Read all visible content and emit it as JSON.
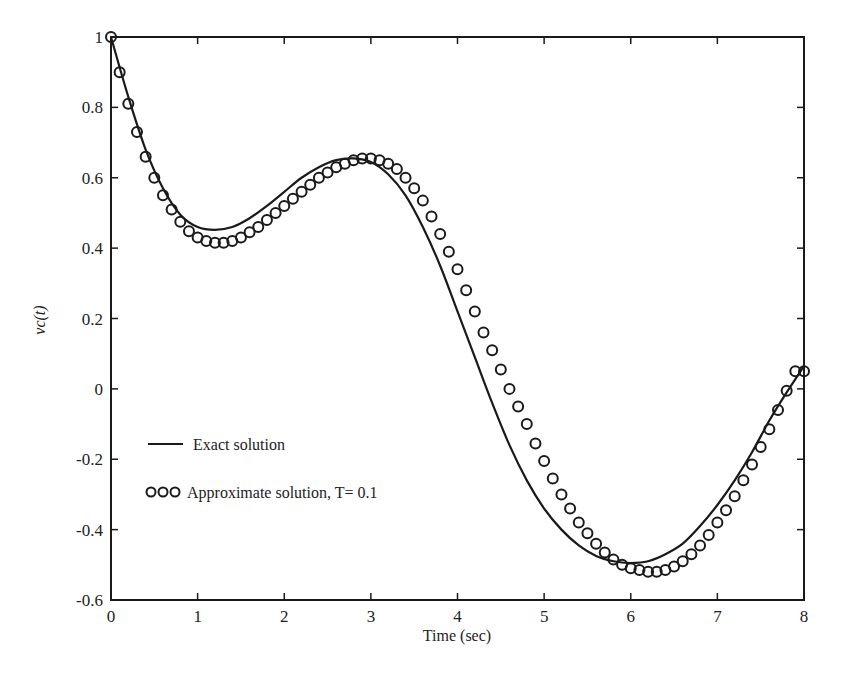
{
  "chart_data": {
    "type": "line",
    "title": "",
    "xlabel": "Time (sec)",
    "ylabel": "vc(t)",
    "xlim": [
      0,
      8
    ],
    "ylim": [
      -0.6,
      1.0
    ],
    "xticks": [
      0,
      1,
      2,
      3,
      4,
      5,
      6,
      7,
      8
    ],
    "xtick_labels": [
      "0",
      "1",
      "2",
      "3",
      "4",
      "5",
      "6",
      "7",
      "8"
    ],
    "yticks": [
      -0.6,
      -0.4,
      -0.2,
      0,
      0.2,
      0.4,
      0.6,
      0.8,
      1.0
    ],
    "ytick_labels": [
      "-0.6",
      "-0.4",
      "-0.2",
      "0",
      "0.2",
      "0.4",
      "0.6",
      "0.8",
      "1"
    ],
    "grid": false,
    "legend_position": "lower-left inside",
    "series": [
      {
        "name": "Exact solution",
        "style": "solid-line",
        "color": "#1a1a1a",
        "x": [
          0,
          0.2,
          0.4,
          0.6,
          0.8,
          1.0,
          1.2,
          1.4,
          1.6,
          1.8,
          2.0,
          2.2,
          2.4,
          2.6,
          2.8,
          3.0,
          3.2,
          3.4,
          3.6,
          3.8,
          4.0,
          4.2,
          4.4,
          4.6,
          4.8,
          5.0,
          5.2,
          5.4,
          5.6,
          5.8,
          6.0,
          6.2,
          6.4,
          6.6,
          6.8,
          7.0,
          7.2,
          7.4,
          7.6,
          7.8,
          8.0
        ],
        "y": [
          1.0,
          0.83,
          0.68,
          0.57,
          0.495,
          0.46,
          0.452,
          0.46,
          0.485,
          0.52,
          0.56,
          0.6,
          0.63,
          0.65,
          0.655,
          0.645,
          0.61,
          0.55,
          0.46,
          0.35,
          0.22,
          0.09,
          -0.04,
          -0.16,
          -0.26,
          -0.34,
          -0.4,
          -0.445,
          -0.475,
          -0.49,
          -0.495,
          -0.49,
          -0.47,
          -0.44,
          -0.39,
          -0.33,
          -0.26,
          -0.18,
          -0.09,
          -0.01,
          0.065
        ]
      },
      {
        "name": "Approximate solution, T= 0.1",
        "style": "open-circle-markers",
        "color": "#1a1a1a",
        "x": [
          0,
          0.1,
          0.2,
          0.3,
          0.4,
          0.5,
          0.6,
          0.7,
          0.8,
          0.9,
          1.0,
          1.1,
          1.2,
          1.3,
          1.4,
          1.5,
          1.6,
          1.7,
          1.8,
          1.9,
          2.0,
          2.1,
          2.2,
          2.3,
          2.4,
          2.5,
          2.6,
          2.7,
          2.8,
          2.9,
          3.0,
          3.1,
          3.2,
          3.3,
          3.4,
          3.5,
          3.6,
          3.7,
          3.8,
          3.9,
          4.0,
          4.1,
          4.2,
          4.3,
          4.4,
          4.5,
          4.6,
          4.7,
          4.8,
          4.9,
          5.0,
          5.1,
          5.2,
          5.3,
          5.4,
          5.5,
          5.6,
          5.7,
          5.8,
          5.9,
          6.0,
          6.1,
          6.2,
          6.3,
          6.4,
          6.5,
          6.6,
          6.7,
          6.8,
          6.9,
          7.0,
          7.1,
          7.2,
          7.3,
          7.4,
          7.5,
          7.6,
          7.7,
          7.8,
          7.9,
          8.0
        ],
        "y": [
          1.0,
          0.9,
          0.81,
          0.73,
          0.66,
          0.6,
          0.55,
          0.51,
          0.475,
          0.448,
          0.43,
          0.42,
          0.415,
          0.415,
          0.42,
          0.43,
          0.445,
          0.46,
          0.48,
          0.5,
          0.52,
          0.54,
          0.56,
          0.58,
          0.6,
          0.615,
          0.63,
          0.64,
          0.65,
          0.655,
          0.655,
          0.65,
          0.64,
          0.625,
          0.6,
          0.57,
          0.535,
          0.49,
          0.44,
          0.39,
          0.34,
          0.28,
          0.22,
          0.16,
          0.11,
          0.055,
          0.0,
          -0.05,
          -0.1,
          -0.155,
          -0.205,
          -0.255,
          -0.3,
          -0.34,
          -0.38,
          -0.41,
          -0.44,
          -0.465,
          -0.485,
          -0.5,
          -0.51,
          -0.515,
          -0.52,
          -0.52,
          -0.515,
          -0.505,
          -0.49,
          -0.47,
          -0.445,
          -0.415,
          -0.38,
          -0.345,
          -0.305,
          -0.26,
          -0.215,
          -0.165,
          -0.115,
          -0.06,
          -0.005,
          0.05,
          0.05
        ]
      }
    ]
  },
  "legend": {
    "exact_label": "Exact solution",
    "approx_label": "Approximate solution, T= 0.1"
  },
  "axes": {
    "x_title": "Time (sec)",
    "y_title_main": "vc",
    "y_title_arg": "(t)"
  }
}
